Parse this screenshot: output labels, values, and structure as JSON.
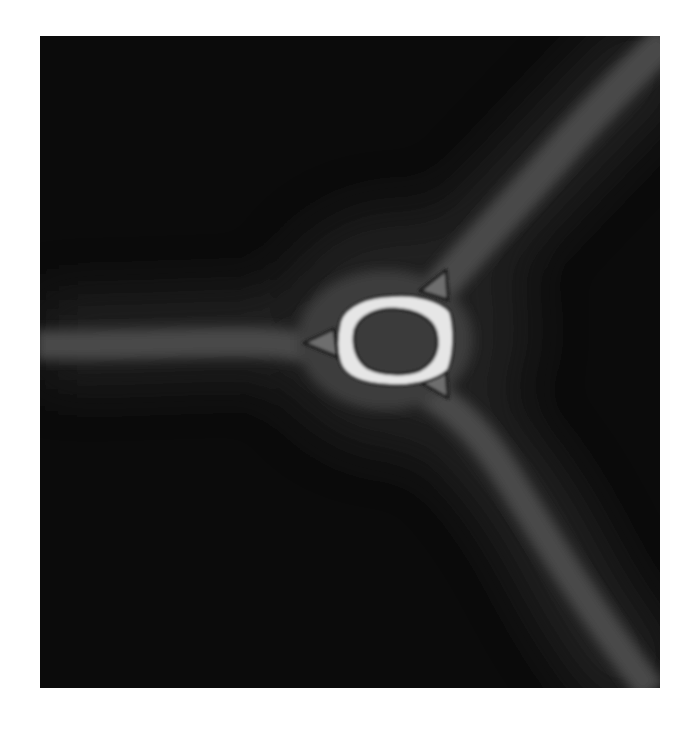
{
  "image": {
    "description": "Grayscale rendering of a three-armed branching structure (Y-shaped) on a black background with a central hollow ring surrounded by three small triangular lobes",
    "colors": {
      "page_background": "#ffffff",
      "frame_background": "#0b0b0b",
      "branch": "#4a4a4a",
      "glow": "#2a2a2a",
      "ring": "#e6e6e6",
      "ring_core": "#3a3a3a",
      "lobe": "#6e6e6e",
      "lobe_outline": "#1a1a1a"
    },
    "frame": {
      "x": 40,
      "y": 36,
      "width": 620,
      "height": 652
    },
    "center": {
      "x": 380,
      "y": 337
    },
    "branches": [
      "left",
      "upper-right",
      "lower-right"
    ],
    "lobes": 3
  }
}
